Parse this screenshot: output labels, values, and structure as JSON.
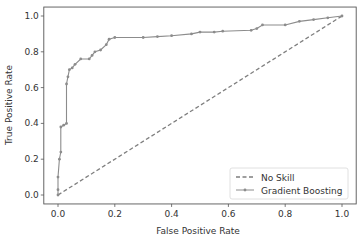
{
  "chart_data": {
    "type": "line",
    "title": "",
    "xlabel": "False Positive Rate",
    "ylabel": "True Positive Rate",
    "xlim": [
      -0.05,
      1.05
    ],
    "ylim": [
      -0.05,
      1.05
    ],
    "xticks": [
      "0.0",
      "0.2",
      "0.4",
      "0.6",
      "0.8",
      "1.0"
    ],
    "yticks": [
      "0.0",
      "0.2",
      "0.4",
      "0.6",
      "0.8",
      "1.0"
    ],
    "grid": false,
    "legend_position": "lower right",
    "series": [
      {
        "name": "No Skill",
        "style": "dashed",
        "color": "#7f7f7f",
        "x": [
          0,
          1
        ],
        "y": [
          0,
          1
        ]
      },
      {
        "name": "Gradient Boosting",
        "style": "solid-with-dot-markers",
        "color": "#8c8c8c",
        "x": [
          0,
          0,
          0,
          0.005,
          0.01,
          0.01,
          0.02,
          0.03,
          0.03,
          0.035,
          0.04,
          0.05,
          0.06,
          0.08,
          0.11,
          0.12,
          0.13,
          0.15,
          0.17,
          0.18,
          0.2,
          0.3,
          0.35,
          0.4,
          0.47,
          0.5,
          0.55,
          0.58,
          0.68,
          0.7,
          0.72,
          0.8,
          0.85,
          0.9,
          0.95,
          1.0
        ],
        "y": [
          0,
          0.03,
          0.1,
          0.2,
          0.24,
          0.38,
          0.39,
          0.4,
          0.62,
          0.66,
          0.7,
          0.71,
          0.73,
          0.76,
          0.76,
          0.78,
          0.8,
          0.81,
          0.84,
          0.87,
          0.88,
          0.88,
          0.885,
          0.89,
          0.9,
          0.91,
          0.91,
          0.915,
          0.92,
          0.93,
          0.95,
          0.95,
          0.97,
          0.98,
          0.99,
          1.0
        ]
      }
    ]
  },
  "legend": {
    "items": [
      {
        "label": "No Skill"
      },
      {
        "label": "Gradient Boosting"
      }
    ]
  },
  "axes": {
    "xlabel": "False Positive Rate",
    "ylabel": "True Positive Rate"
  }
}
